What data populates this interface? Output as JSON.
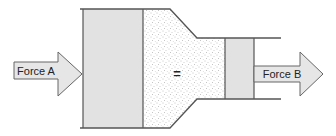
{
  "diagram": {
    "type": "hydraulic-press",
    "labels": {
      "force_a": "Force A",
      "force_b": "Force B",
      "equals": "="
    },
    "colors": {
      "piston_fill": "#e2e2e2",
      "arrow_fill": "#e6e6e6",
      "outline": "#555555",
      "fluid_fill": "#ffffff",
      "fluid_dots": "#8a8a8a"
    }
  }
}
